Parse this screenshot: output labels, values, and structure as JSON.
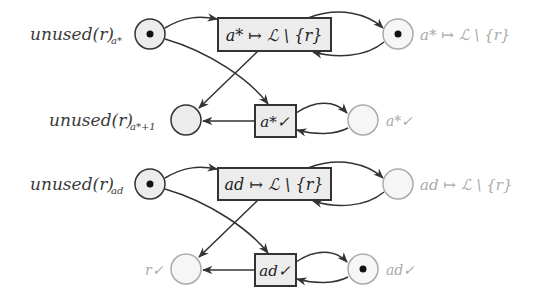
{
  "diagram": {
    "type": "petri-net",
    "colors": {
      "stroke": "#333333",
      "stroke_light": "#aaaaaa",
      "place_fill": "#ececec",
      "place_fill_light": "#f6f6f6",
      "transition_fill": "#ececec",
      "label_dark": "#3a3a3a",
      "label_light": "#aaaaaa"
    },
    "places": [
      {
        "id": "p1",
        "label": "unused(r)",
        "sub": "a*",
        "marked": true,
        "faded": false
      },
      {
        "id": "p2",
        "label": "a* ↦ ℒ \\ {r}",
        "marked": true,
        "faded": true
      },
      {
        "id": "p3",
        "label": "unused(r)",
        "sub": "a*+1",
        "marked": false,
        "faded": false
      },
      {
        "id": "p4",
        "label": "a*✓",
        "marked": false,
        "faded": true
      },
      {
        "id": "p5",
        "label": "unused(r)",
        "sub": "ad",
        "marked": true,
        "faded": false
      },
      {
        "id": "p6",
        "label": "ad ↦ ℒ \\ {r}",
        "marked": false,
        "faded": true
      },
      {
        "id": "p7",
        "label": "r✓",
        "marked": false,
        "faded": true
      },
      {
        "id": "p8",
        "label": "ad✓",
        "marked": true,
        "faded": true
      }
    ],
    "transitions": [
      {
        "id": "t1",
        "label": "a* ↦ ℒ \\ {r}"
      },
      {
        "id": "t2",
        "label": "a*✓"
      },
      {
        "id": "t3",
        "label": "ad ↦ ℒ \\ {r}"
      },
      {
        "id": "t4",
        "label": "ad✓"
      }
    ],
    "text": {
      "p1_main": "unused(r)",
      "p1_sub": "a*",
      "p2_main": "a* ↦ ℒ \\ {r}",
      "p3_main": "unused(r)",
      "p3_sub": "a*+1",
      "p4_main": "a*✓",
      "p5_main": "unused(r)",
      "p5_sub": "ad",
      "p6_main": "ad ↦ ℒ \\ {r}",
      "p7_main": "r✓",
      "p8_main": "ad✓",
      "t1_main": "a* ↦ ℒ \\ {r}",
      "t2_main": "a*✓",
      "t3_main": "ad ↦ ℒ \\ {r}",
      "t4_main": "ad✓"
    },
    "arcs": [
      {
        "from": "p1",
        "to": "t1"
      },
      {
        "from": "p1",
        "to": "t2"
      },
      {
        "from": "t1",
        "to": "p2"
      },
      {
        "from": "p2",
        "to": "t1"
      },
      {
        "from": "t1",
        "to": "p3"
      },
      {
        "from": "t2",
        "to": "p3"
      },
      {
        "from": "t2",
        "to": "p4"
      },
      {
        "from": "p4",
        "to": "t2"
      },
      {
        "from": "p5",
        "to": "t3"
      },
      {
        "from": "p5",
        "to": "t4"
      },
      {
        "from": "t3",
        "to": "p6"
      },
      {
        "from": "p6",
        "to": "t3"
      },
      {
        "from": "t3",
        "to": "p7"
      },
      {
        "from": "t4",
        "to": "p7"
      },
      {
        "from": "t4",
        "to": "p8"
      },
      {
        "from": "p8",
        "to": "t4"
      }
    ]
  }
}
